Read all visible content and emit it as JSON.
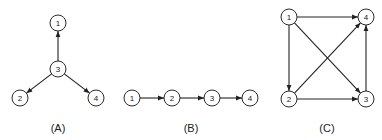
{
  "diagrams": [
    {
      "id": "A",
      "label": "(A)",
      "label_pos": [
        58,
        128
      ],
      "nodes": [
        {
          "id": "1",
          "label": "1",
          "x": 58,
          "y": 23
        },
        {
          "id": "3",
          "label": "3",
          "x": 58,
          "y": 69
        },
        {
          "id": "2",
          "label": "2",
          "x": 20,
          "y": 98
        },
        {
          "id": "4",
          "label": "4",
          "x": 96,
          "y": 98
        }
      ],
      "edges": [
        {
          "from": "3",
          "to": "1"
        },
        {
          "from": "3",
          "to": "2"
        },
        {
          "from": "3",
          "to": "4"
        }
      ]
    },
    {
      "id": "B",
      "label": "(B)",
      "label_pos": [
        191,
        128
      ],
      "nodes": [
        {
          "id": "1",
          "label": "1",
          "x": 132,
          "y": 98
        },
        {
          "id": "2",
          "label": "2",
          "x": 172,
          "y": 98
        },
        {
          "id": "3",
          "label": "3",
          "x": 212,
          "y": 98
        },
        {
          "id": "4",
          "label": "4",
          "x": 250,
          "y": 98
        }
      ],
      "edges": [
        {
          "from": "1",
          "to": "2"
        },
        {
          "from": "2",
          "to": "3"
        },
        {
          "from": "3",
          "to": "4"
        }
      ]
    },
    {
      "id": "C",
      "label": "(C)",
      "label_pos": [
        327,
        128
      ],
      "nodes": [
        {
          "id": "1",
          "label": "1",
          "x": 289,
          "y": 17
        },
        {
          "id": "4",
          "label": "4",
          "x": 366,
          "y": 17
        },
        {
          "id": "2",
          "label": "2",
          "x": 289,
          "y": 99
        },
        {
          "id": "3",
          "label": "3",
          "x": 366,
          "y": 99
        }
      ],
      "edges": [
        {
          "from": "1",
          "to": "4"
        },
        {
          "from": "1",
          "to": "2"
        },
        {
          "from": "1",
          "to": "3"
        },
        {
          "from": "2",
          "to": "4"
        },
        {
          "from": "2",
          "to": "3"
        },
        {
          "from": "3",
          "to": "4"
        }
      ]
    }
  ],
  "style": {
    "stroke": "#222222",
    "node_fill": "#ffffff",
    "node_radius": 8
  }
}
